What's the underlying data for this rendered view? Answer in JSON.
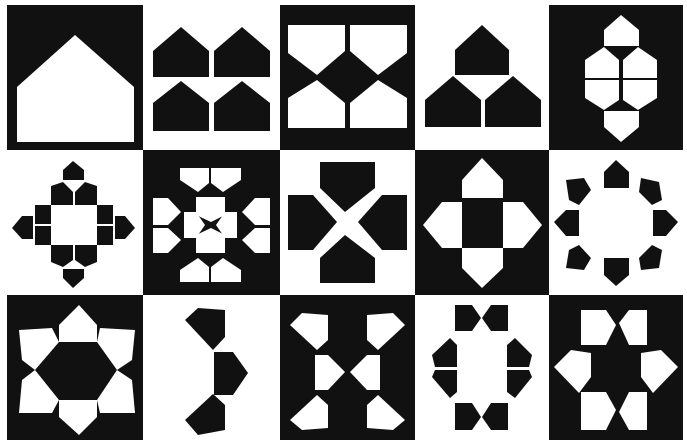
{
  "colors": {
    "dark": "#111111",
    "light": "#ffffff"
  },
  "grid": {
    "rows": 3,
    "cols": 5
  },
  "tiles": [
    {
      "row": 1,
      "col": 1,
      "background": "dark",
      "motif": "single large white house pentagon"
    },
    {
      "row": 1,
      "col": 2,
      "background": "light",
      "motif": "four black house pentagons in 2x2"
    },
    {
      "row": 1,
      "col": 3,
      "background": "dark",
      "motif": "four white pentagons meeting at black diamond"
    },
    {
      "row": 1,
      "col": 4,
      "background": "light",
      "motif": "three black house pentagons stacked pyramid"
    },
    {
      "row": 1,
      "col": 5,
      "background": "dark",
      "motif": "six white pentagons forming elongated hexagon"
    },
    {
      "row": 2,
      "col": 1,
      "background": "light",
      "motif": "black pentagons ringing a white square, diamond outline"
    },
    {
      "row": 2,
      "col": 2,
      "background": "dark",
      "motif": "white pentagons forming X cross star"
    },
    {
      "row": 2,
      "col": 3,
      "background": "light",
      "motif": "four black pentagons forming X cross"
    },
    {
      "row": 2,
      "col": 4,
      "background": "dark",
      "motif": "four white pentagons around black square cross"
    },
    {
      "row": 2,
      "col": 5,
      "background": "light",
      "motif": "eight black pentagons in octagonal ring"
    },
    {
      "row": 3,
      "col": 1,
      "background": "dark",
      "motif": "six white pentagons around black hexagon rosette"
    },
    {
      "row": 3,
      "col": 2,
      "background": "light",
      "motif": "three black pentagons in curved arc"
    },
    {
      "row": 3,
      "col": 3,
      "background": "dark",
      "motif": "six white pentagons forming hourglass X"
    },
    {
      "row": 3,
      "col": 4,
      "background": "light",
      "motif": "eight black pentagons forming oval ring"
    },
    {
      "row": 3,
      "col": 5,
      "background": "dark",
      "motif": "six white pentagons around black star"
    }
  ]
}
